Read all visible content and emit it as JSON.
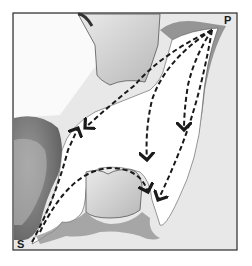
{
  "figure": {
    "type": "anatomical-diagram",
    "labels": {
      "p": "P",
      "s": "S"
    },
    "colors": {
      "frame": "#2a2a2a",
      "background": "#e6e6e6",
      "cavity": "#ffffff",
      "gum_dark": "#6e6e6e",
      "tooth": "#d8d8d8",
      "arrow": "#1a1a1a"
    },
    "arrows": [
      {
        "from": "P",
        "to": "left-upper",
        "direction": "down-left"
      },
      {
        "from": "P",
        "to": "middle",
        "direction": "down"
      },
      {
        "from": "P",
        "to": "right",
        "direction": "down"
      },
      {
        "from": "P",
        "to": "lower-right",
        "direction": "down-left"
      },
      {
        "from": "S",
        "to": "upper-left",
        "direction": "up"
      },
      {
        "from": "S",
        "to": "center-lower",
        "direction": "arc-right-down"
      }
    ]
  }
}
